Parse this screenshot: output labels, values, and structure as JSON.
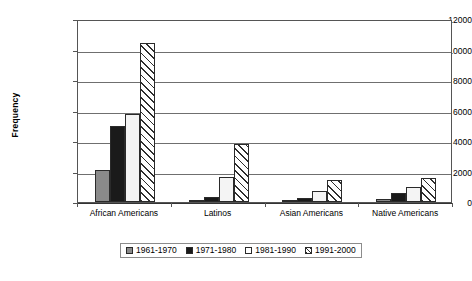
{
  "chart_data": {
    "type": "bar",
    "title": "",
    "xlabel": "",
    "ylabel": "Frequency",
    "ylim": [
      0,
      12000
    ],
    "ytick_labels": [
      "12000",
      "10000",
      "8000",
      "6000",
      "4000",
      "2000",
      "0"
    ],
    "ytick_values": [
      12000,
      10000,
      8000,
      6000,
      4000,
      2000,
      0
    ],
    "grid": true,
    "legend_position": "bottom",
    "categories": [
      "African Americans",
      "Latinos",
      "Asian Americans",
      "Native Americans"
    ],
    "series": [
      {
        "name": "1961-1970",
        "values": [
          2100,
          30,
          40,
          230
        ]
      },
      {
        "name": "1971-1980",
        "values": [
          5000,
          350,
          250,
          600
        ]
      },
      {
        "name": "1981-1990",
        "values": [
          5800,
          1650,
          750,
          1000
        ]
      },
      {
        "name": "1991-2000",
        "values": [
          10400,
          3800,
          1450,
          1550
        ]
      }
    ]
  },
  "legend": {
    "items": [
      {
        "label": "1961-1970"
      },
      {
        "label": "1971-1980"
      },
      {
        "label": "1981-1990"
      },
      {
        "label": "1991-2000"
      }
    ]
  },
  "colors": {
    "series_1961_1970": "#8a8a8a",
    "series_1971_1980": "#1a1a1a",
    "series_1981_1990": "#f4f4f4",
    "series_1991_2000": "#ffffff",
    "axis": "#555555",
    "gridline": "#6f6f6f",
    "background": "#ffffff"
  }
}
